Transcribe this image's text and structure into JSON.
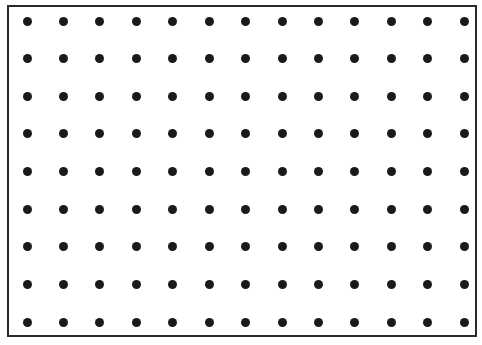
{
  "figure": {
    "type": "dot-grid",
    "canvas_width_px": 482,
    "canvas_height_px": 345,
    "background_color": "#ffffff"
  },
  "frame": {
    "name": "border-rectangle",
    "left_px": 7,
    "top_px": 5,
    "right_px": 477,
    "bottom_px": 337,
    "width_px": 470,
    "height_px": 332,
    "stroke_color": "#2b2b2b",
    "stroke_width_px": 2,
    "fill": "none"
  },
  "grid": {
    "name": "dot-lattice",
    "columns": 13,
    "rows": 9,
    "total_dots": 117,
    "dot_diameter_px": 9,
    "dot_color": "#1a1a1a",
    "dot_shape": "circle",
    "origin_x_px": 27,
    "origin_y_px": 21,
    "spacing_x_px": 36.42,
    "spacing_y_px": 37.63,
    "arrangement": "aligned rectangular lattice",
    "column_centers_x_px": [
      27,
      63.4,
      99.8,
      136.3,
      172.7,
      209.1,
      245.5,
      282,
      318.4,
      354.8,
      391.2,
      427.6,
      464
    ],
    "row_centers_y_px": [
      21,
      58.6,
      96.3,
      133.9,
      171.5,
      209.1,
      246.8,
      284.4,
      322
    ]
  },
  "chart_data": {
    "type": "scatter",
    "xlabel": "",
    "ylabel": "",
    "grid": false,
    "legend": "none",
    "columns": 13,
    "rows": 9,
    "point_count": 117,
    "x": [
      27,
      63.4,
      99.8,
      136.3,
      172.7,
      209.1,
      245.5,
      282,
      318.4,
      354.8,
      391.2,
      427.6,
      464
    ],
    "y": [
      21,
      58.6,
      96.3,
      133.9,
      171.5,
      209.1,
      246.8,
      284.4,
      322
    ]
  }
}
